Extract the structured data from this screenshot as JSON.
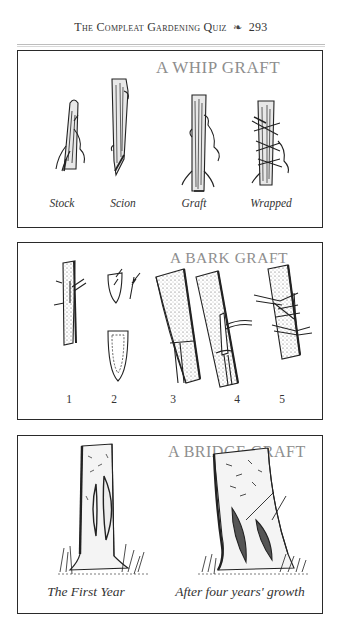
{
  "header": {
    "running_title": "The Compleat Gardening Quiz",
    "ornament": "❧",
    "page_number": "293"
  },
  "panels": [
    {
      "title": "A WHIP GRAFT",
      "captions": [
        "Stock",
        "Scion",
        "Graft",
        "Wrapped"
      ]
    },
    {
      "title": "A BARK GRAFT",
      "steps": [
        "1",
        "2",
        "3",
        "4",
        "5"
      ]
    },
    {
      "title": "A BRIDGE GRAFT",
      "captions": [
        "The First Year",
        "After four years' growth"
      ]
    }
  ],
  "colors": {
    "ink": "#222222",
    "title_gray": "#8e8e8e",
    "border": "#2a2a2a",
    "rule": "#bdbdbd"
  }
}
